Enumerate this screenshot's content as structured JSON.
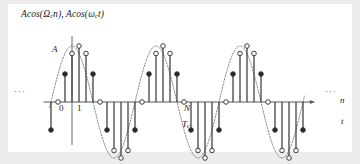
{
  "figure": {
    "title_plain": "Acos(Ωcn), Acos(ωct)",
    "title_part1": "Acos(",
    "title_omega_d": "Ω",
    "title_sub_c1": "c",
    "title_mid": "n), Acos(",
    "title_omega_a": "ω",
    "title_sub_c2": "c",
    "title_end": "t)",
    "amplitude_label": "A",
    "tick_0": "0",
    "tick_1": "1",
    "period_label": "N",
    "period_time_label": "T",
    "period_time_sub": "c",
    "x_axis_label_discrete": "n",
    "x_axis_label_continuous": "t",
    "ellipsis_left": "···",
    "ellipsis_right": "···",
    "panel_bg": "#ffffff",
    "page_bg": "#ececed",
    "axis_color": "#58585a",
    "stem_color": "#3a3a3c",
    "envelope_color": "#77777a",
    "marker_fill_open": "#ffffff",
    "marker_fill_solid": "#2a2a2c",
    "marker_stroke": "#2a2a2c"
  },
  "chart_data": {
    "type": "line",
    "title": "Acos(Ωcn), Acos(ωct)",
    "xlabel": "n",
    "ylabel": "",
    "grid": false,
    "legend": null,
    "amplitude": 1.0,
    "samples_per_period": 12,
    "periods_shown": 3,
    "axis_baseline_y": 0,
    "ylim": [
      -1.15,
      1.15
    ],
    "xlim": [
      -3.2,
      33.2
    ],
    "x": [
      -3,
      -2,
      -1,
      0,
      1,
      2,
      3,
      4,
      5,
      6,
      7,
      8,
      9,
      10,
      11,
      12,
      13,
      14,
      15,
      16,
      17,
      18,
      19,
      20,
      21,
      22,
      23,
      24,
      25,
      26,
      27,
      28,
      29,
      30,
      31,
      32,
      33
    ],
    "values": [
      -0.5,
      0.0,
      0.5,
      0.866,
      1.0,
      0.866,
      0.5,
      0.0,
      -0.5,
      -0.866,
      -1.0,
      -0.866,
      -0.5,
      0.0,
      0.5,
      0.866,
      1.0,
      0.866,
      0.5,
      0.0,
      -0.5,
      -0.866,
      -1.0,
      -0.866,
      -0.5,
      0.0,
      0.5,
      0.866,
      1.0,
      0.866,
      0.5,
      0.0,
      -0.5,
      -0.866,
      -1.0,
      -0.866,
      -0.5
    ],
    "envelope": {
      "name": "Acos(ωct)",
      "style": "dotted",
      "continuous": true
    },
    "series": [
      {
        "name": "Acos(Ωcn)",
        "style": "stem",
        "marker": "circle"
      }
    ],
    "annotations": [
      {
        "text": "A",
        "x": 0,
        "y": 1.0,
        "note": "peak amplitude marker on vertical axis"
      },
      {
        "text": "0",
        "x": 0,
        "y": 0,
        "note": "origin tick below axis"
      },
      {
        "text": "1",
        "x": 1,
        "y": 0,
        "note": "first sample index"
      },
      {
        "text": "N",
        "x": 16,
        "y": 0,
        "note": "discrete period in samples"
      },
      {
        "text": "Tc",
        "x": 16,
        "y": -0.25,
        "note": "continuous-time carrier period"
      }
    ],
    "tick_labels_x": [
      "0",
      "1",
      "N"
    ],
    "tick_labels_y": [
      "A"
    ]
  }
}
